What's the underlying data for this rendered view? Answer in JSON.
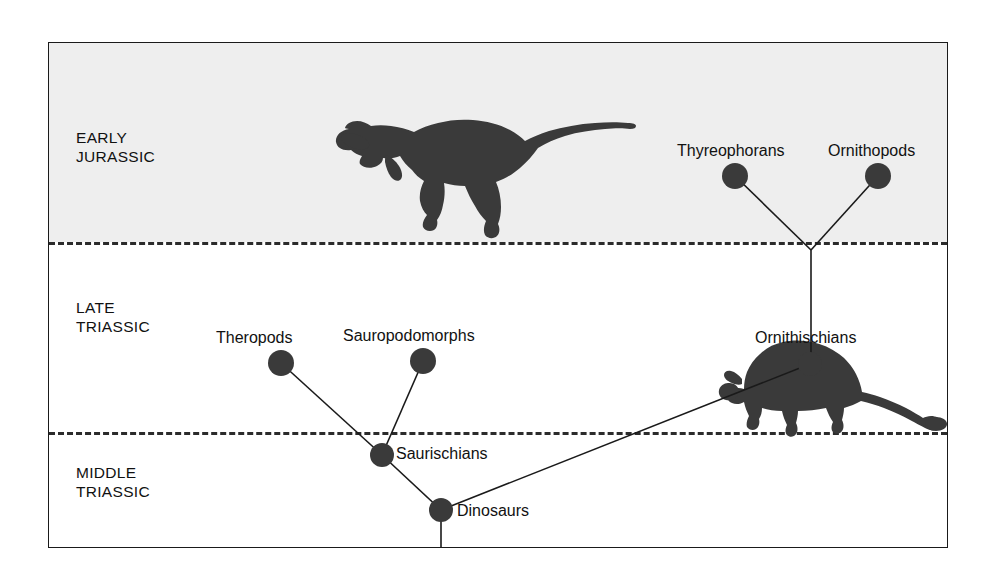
{
  "diagram": {
    "type": "cladogram",
    "background_color": "#ffffff",
    "node_color": "#3a3a3a",
    "line_color": "#1a1a1a",
    "band_shaded_color": "#eeeeee"
  },
  "time_bands": [
    {
      "id": "early-jurassic",
      "label": "EARLY\nJURASSIC",
      "shaded": true
    },
    {
      "id": "late-triassic",
      "label": "LATE\nTRIASSIC",
      "shaded": false
    },
    {
      "id": "middle-triassic",
      "label": "MIDDLE\nTRIASSIC",
      "shaded": false
    }
  ],
  "nodes": [
    {
      "id": "theropods",
      "label": "Theropods",
      "x": 232,
      "y": 320,
      "band": "late-triassic",
      "label_dx": -65,
      "label_dy": -34
    },
    {
      "id": "sauropodomorphs",
      "label": "Sauropodomorphs",
      "x": 374,
      "y": 318,
      "band": "late-triassic",
      "label_dx": -80,
      "label_dy": -34
    },
    {
      "id": "saurischians",
      "label": "Saurischians",
      "x": 333,
      "y": 412,
      "band": "late-triassic",
      "label_dx": 14,
      "label_dy": -10
    },
    {
      "id": "dinosaurs",
      "label": "Dinosaurs",
      "x": 392,
      "y": 467,
      "band": "middle-triassic",
      "label_dx": 16,
      "label_dy": 2
    },
    {
      "id": "ornithischians",
      "label": "Ornithischians",
      "x": 761,
      "y": 321,
      "band": "late-triassic",
      "label_dx": -55,
      "label_dy": -35
    },
    {
      "id": "thyreophorans",
      "label": "Thyreophorans",
      "x": 686,
      "y": 133,
      "band": "early-jurassic",
      "label_dx": -58,
      "label_dy": -34
    },
    {
      "id": "ornithopods",
      "label": "Ornithopods",
      "x": 829,
      "y": 133,
      "band": "early-jurassic",
      "label_dx": -50,
      "label_dy": -34
    }
  ],
  "junctions": [
    {
      "id": "ornithischian-split",
      "x": 762,
      "y": 207
    }
  ],
  "edges": [
    {
      "id": "edge-theropods-saurischians",
      "from": "theropods",
      "to": "saurischians"
    },
    {
      "id": "edge-sauropodomorphs-saurischians",
      "from": "sauropodomorphs",
      "to": "saurischians"
    },
    {
      "id": "edge-saurischians-dinosaurs",
      "from": "saurischians",
      "to": "dinosaurs"
    },
    {
      "id": "edge-ornithischians-dinosaurs",
      "from": "ornithischians",
      "to": "dinosaurs"
    },
    {
      "id": "edge-thyreophorans-split",
      "from": "thyreophorans",
      "to": "ornithischian-split"
    },
    {
      "id": "edge-ornithopods-split",
      "from": "ornithopods",
      "to": "ornithischian-split"
    },
    {
      "id": "edge-split-ornithischians",
      "from": "ornithischian-split",
      "to": "ornithischians"
    },
    {
      "id": "edge-dinosaurs-root",
      "from": "dinosaurs",
      "to": "root"
    }
  ],
  "silhouettes": [
    {
      "id": "theropod-silhouette",
      "name": "theropod-dinosaur-silhouette",
      "band": "early-jurassic"
    },
    {
      "id": "ankylosaur-silhouette",
      "name": "ankylosaur-dinosaur-silhouette",
      "band": "late-triassic"
    }
  ]
}
